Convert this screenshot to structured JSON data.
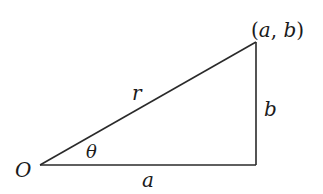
{
  "diagram": {
    "vertices": {
      "origin": {
        "label": "O",
        "x": 40,
        "y": 165
      },
      "corner": {
        "x": 256,
        "y": 165
      },
      "point": {
        "label": "(a, b)",
        "x": 256,
        "y": 42
      }
    },
    "labels": {
      "origin": "O",
      "point_open": "(",
      "point_a": "a",
      "point_comma": ", ",
      "point_b": "b",
      "point_close": ")",
      "hypotenuse": "r",
      "vertical_side": "b",
      "horizontal_side": "a",
      "angle": "θ"
    },
    "colors": {
      "line": "#2a2a2a",
      "text": "#1a1a1a",
      "background": "#ffffff"
    }
  }
}
